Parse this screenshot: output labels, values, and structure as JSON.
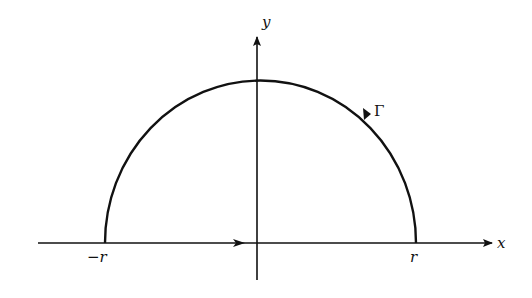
{
  "diagram": {
    "type": "contour-integration-semicircle",
    "colors": {
      "ink": "#111111",
      "background": "#ffffff"
    },
    "axes": {
      "x_label": "x",
      "y_label": "y"
    },
    "contour": {
      "name": "Γ",
      "shape": "upper semicircle",
      "orientation": "counterclockwise"
    },
    "points": {
      "left_label": "−r",
      "right_label": "r"
    }
  }
}
